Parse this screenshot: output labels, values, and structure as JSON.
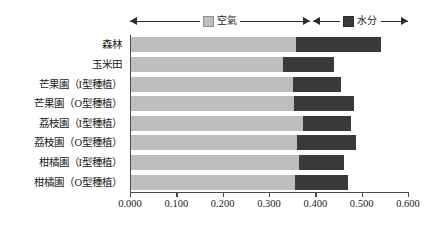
{
  "chart_data": {
    "type": "bar",
    "orientation": "horizontal",
    "stacked": true,
    "title": "",
    "xlabel": "",
    "ylabel": "",
    "xlim": [
      0.0,
      0.6
    ],
    "xticks": [
      "0.000",
      "0.100",
      "0.200",
      "0.300",
      "0.400",
      "0.500",
      "0.600"
    ],
    "xtick_values": [
      0.0,
      0.1,
      0.2,
      0.3,
      0.4,
      0.5,
      0.6
    ],
    "grid": false,
    "legend_position": "top",
    "categories": [
      "森林",
      "玉米田",
      "芒果園（I型種植）",
      "芒果園（O型種植）",
      "荔枝園（I型種植）",
      "荔枝園（O型種植）",
      "柑橘園（I型種植）",
      "柑橘園（O型種植）"
    ],
    "series": [
      {
        "name": "空氣",
        "color": "#bebebe",
        "values": [
          0.357,
          0.328,
          0.35,
          0.352,
          0.372,
          0.359,
          0.363,
          0.355
        ]
      },
      {
        "name": "水分",
        "color": "#3a3a3a",
        "values": [
          0.183,
          0.11,
          0.103,
          0.13,
          0.103,
          0.127,
          0.097,
          0.114
        ]
      }
    ],
    "totals": [
      0.54,
      0.438,
      0.453,
      0.482,
      0.475,
      0.486,
      0.46,
      0.469
    ]
  },
  "legend": {
    "air": {
      "label": "空氣",
      "swatch": "legend-swatch-air"
    },
    "water": {
      "label": "水分",
      "swatch": "legend-swatch-water"
    }
  },
  "axis": {
    "x_tick_labels": [
      "0.000",
      "0.100",
      "0.200",
      "0.300",
      "0.400",
      "0.500",
      "0.600"
    ]
  }
}
